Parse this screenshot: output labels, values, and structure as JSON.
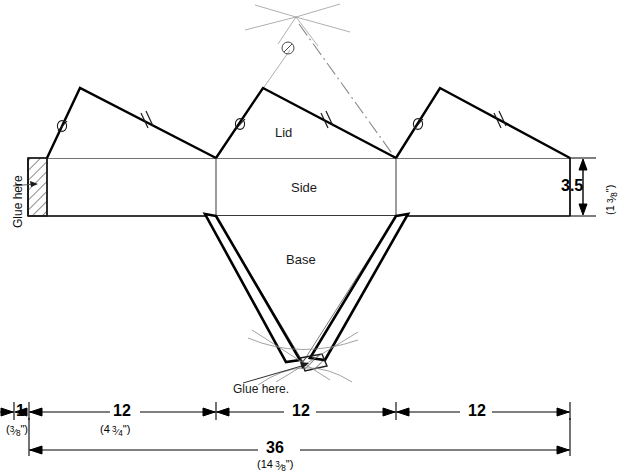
{
  "drawing": {
    "title": "Box net / development drawing",
    "panels": [
      {
        "name": "lid",
        "label": "Lid"
      },
      {
        "name": "side",
        "label": "Side"
      },
      {
        "name": "base",
        "label": "Base"
      }
    ],
    "glue_tab_left": "Glue here",
    "glue_note_bottom": "Glue here.",
    "edge_marks": {
      "single_tick": "Ø",
      "double_tick": "//"
    }
  },
  "dimensions": {
    "height": {
      "value": "3.5",
      "alt": "(1 3/8\")",
      "alt_whole": "1",
      "alt_num": "3",
      "alt_den": "8"
    },
    "tab_width": {
      "value": "1",
      "alt": "(3/8\")",
      "alt_num": "3",
      "alt_den": "8"
    },
    "segment_1": {
      "value": "12",
      "alt": "(4 3/4\")",
      "alt_whole": "4",
      "alt_num": "3",
      "alt_den": "4"
    },
    "segment_2": {
      "value": "12",
      "alt": ""
    },
    "segment_3": {
      "value": "12",
      "alt": ""
    },
    "total": {
      "value": "36",
      "alt": "(14 3/8\")",
      "alt_whole": "14",
      "alt_num": "3",
      "alt_den": "8"
    }
  },
  "colors": {
    "line": "#000000",
    "thin_line": "#4a4a4a",
    "construction": "#9a9a9a",
    "text": "#111111",
    "background": "#ffffff"
  }
}
